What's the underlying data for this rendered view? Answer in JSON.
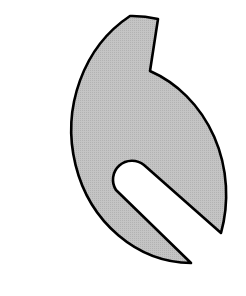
{
  "diagram": {
    "colors": {
      "fill": "#bdbdbd",
      "stroke": "#000000",
      "background": "#ffffff"
    },
    "shapes": [
      {
        "name": "notched-slotted-disc",
        "type": "path"
      }
    ]
  }
}
